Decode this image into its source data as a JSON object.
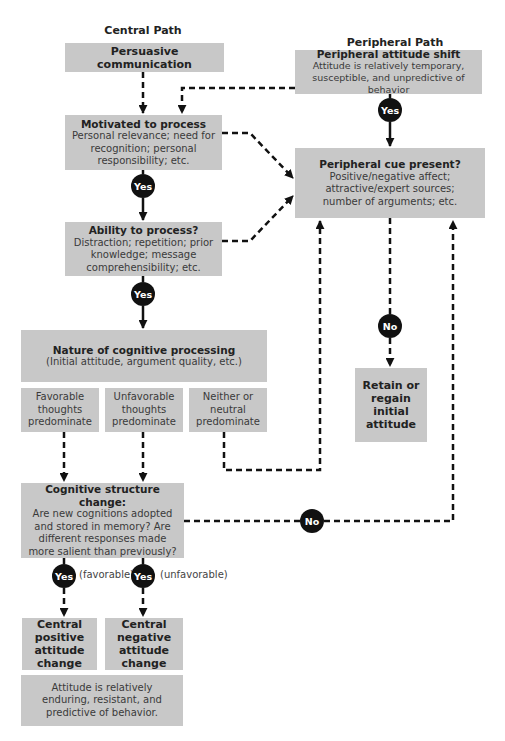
{
  "headers": {
    "central_path": "Central Path",
    "peripheral_path": "Peripheral Path"
  },
  "central": {
    "persuasive": "Persuasive communication",
    "motivated": {
      "title": "Motivated to process",
      "desc": "Personal relevance; need for recognition; personal responsibility; etc."
    },
    "ability": {
      "title": "Ability to process?",
      "desc": "Distraction; repetition; prior knowledge; message comprehensibility; etc."
    },
    "nature": {
      "title": "Nature of cognitive processing",
      "desc": "(Initial attitude, argument quality, etc.)"
    },
    "outcomes": [
      {
        "label": "Favorable thoughts predominate"
      },
      {
        "label": "Unfavorable thoughts predominate"
      },
      {
        "label": "Neither or neutral predominate"
      }
    ],
    "structure_change": {
      "title": "Cognitive structure change:",
      "desc": "Are new cognitions adopted and stored in memory? Are different responses made more salient than previously?"
    },
    "positive_change": "Central positive attitude change",
    "negative_change": "Central negative attitude change",
    "enduring": "Attitude is relatively enduring, resistant, and predictive of behavior."
  },
  "peripheral": {
    "shift": {
      "title": "Peripheral attitude shift",
      "desc": "Attitude is relatively temporary, susceptible, and unpredictive of behavior"
    },
    "cue": {
      "title": "Peripheral cue present?",
      "desc": "Positive/negative affect; attractive/expert sources; number of arguments; etc."
    },
    "retain": "Retain or regain initial attitude"
  },
  "decisions": {
    "yes": "Yes",
    "no": "No",
    "favorable_note": "(favorable)",
    "unfavorable_note": "(unfavorable)"
  },
  "colors": {
    "box_fill": "#c8c8c8",
    "decision_fill": "#111111",
    "line": "#111111"
  }
}
